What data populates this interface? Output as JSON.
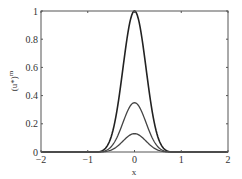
{
  "chart_data": {
    "type": "line",
    "title": "",
    "xlabel": "x",
    "ylabel": "(u*)^m",
    "xlim": [
      -2,
      2
    ],
    "ylim": [
      0,
      1
    ],
    "grid": false,
    "legend": null,
    "xticks": [
      "-2",
      "-1",
      "0",
      "1",
      "2"
    ],
    "yticks": [
      "0",
      "0.2",
      "0.4",
      "0.6",
      "0.8",
      "1"
    ],
    "series": [
      {
        "name": "curve-1",
        "peak_x": 0,
        "peak_y": 1.0,
        "support": [
          -0.8,
          0.8
        ],
        "color": "#222222"
      },
      {
        "name": "curve-2",
        "peak_x": 0,
        "peak_y": 0.35,
        "support": [
          -0.8,
          0.8
        ],
        "color": "#444444"
      },
      {
        "name": "curve-3",
        "peak_x": 0,
        "peak_y": 0.13,
        "support": [
          -0.8,
          0.8
        ],
        "color": "#444444"
      }
    ]
  },
  "axes": {
    "xlabel": "x",
    "ylabel_base": "(u*)",
    "ylabel_sup": "m"
  }
}
